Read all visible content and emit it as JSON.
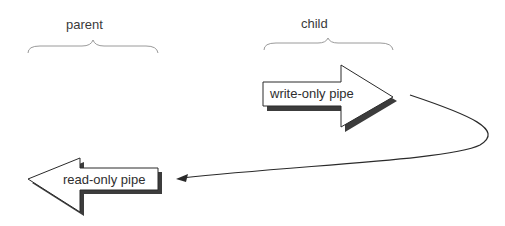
{
  "diagram": {
    "groups": [
      {
        "id": "parent",
        "label": "parent"
      },
      {
        "id": "child",
        "label": "child"
      }
    ],
    "pipes": [
      {
        "id": "write",
        "label": "write-only pipe",
        "owner": "child",
        "direction": "right"
      },
      {
        "id": "read",
        "label": "read-only pipe",
        "owner": "parent",
        "direction": "left"
      }
    ],
    "connector": {
      "from": "write",
      "to": "read",
      "style": "curved-arrow"
    },
    "colors": {
      "stroke": "#2a2a2a",
      "shadow": "#3c3c3c",
      "brace": "#9a9a9a",
      "fill": "#ffffff"
    }
  }
}
